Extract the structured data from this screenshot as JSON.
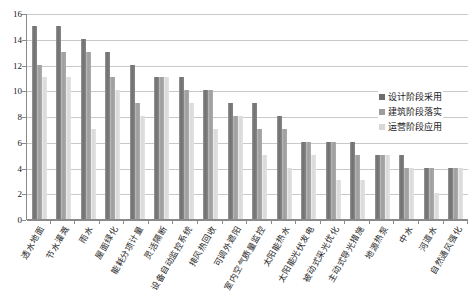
{
  "chart_data": {
    "type": "bar",
    "title": "",
    "subtitle": "",
    "xlabel": "",
    "ylabel": "",
    "ylim": [
      0,
      16
    ],
    "ytick_step": 2,
    "yticks": [
      16,
      14,
      12,
      10,
      8,
      6,
      4,
      2,
      0
    ],
    "grid": true,
    "legend_position": "right",
    "categories": [
      "透水地面",
      "节水灌溉",
      "雨水",
      "屋面绿化",
      "能耗分项计量",
      "灵活隔断",
      "设备自动监控系统",
      "排风热回收",
      "可调外遮阳",
      "室内空气质量监控",
      "太阳能热水",
      "太阳能光伏发电",
      "被动式采光优化",
      "主动式导光措施",
      "地源热泵",
      "中水",
      "河道水",
      "自然通风强化"
    ],
    "series": [
      {
        "name": "设计阶段采用",
        "color": "#6e6e6e",
        "values": [
          15,
          15,
          14,
          13,
          12,
          11,
          11,
          10,
          9,
          9,
          8,
          6,
          6,
          6,
          5,
          5,
          4,
          4
        ]
      },
      {
        "name": "建筑阶段落实",
        "color": "#9d9d9d",
        "values": [
          12,
          13,
          13,
          11,
          9,
          11,
          10,
          10,
          8,
          7,
          7,
          6,
          6,
          5,
          5,
          4,
          4,
          4
        ]
      },
      {
        "name": "运营阶段应用",
        "color": "#d8d8d8",
        "values": [
          11,
          11,
          7,
          10,
          8,
          11,
          9,
          7,
          8,
          5,
          4,
          5,
          3,
          3,
          5,
          4,
          2,
          4
        ]
      }
    ]
  }
}
